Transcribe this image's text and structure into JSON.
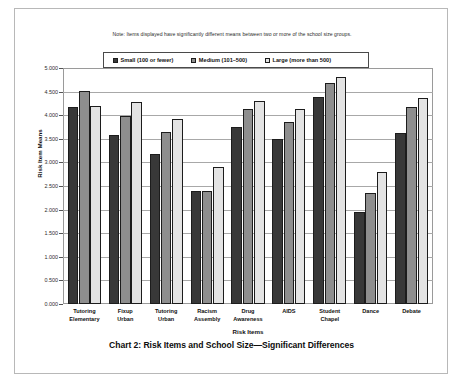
{
  "caption": "Chart 2: Risk Items and School Size—Significant Differences",
  "note": "Note: Items displayed have significantly different means between two or more of the school size groups.",
  "legend": {
    "items": [
      {
        "label": "Small (100 or fewer)",
        "color": "#383838"
      },
      {
        "label": "Medium (101–500)",
        "color": "#8e8e8e"
      },
      {
        "label": "Large (more than 500)",
        "color": "#e3e3e3"
      }
    ]
  },
  "chart_data": {
    "type": "bar",
    "title": "Chart 2: Risk Items and School Size—Significant Differences",
    "subtitle": "Note: Items displayed have significantly different means between two or more of the school size groups.",
    "xlabel": "Risk Items",
    "ylabel": "Risk Item Means",
    "ylim": [
      0.0,
      5.0
    ],
    "yticks": [
      "0.000",
      "0.500",
      "1.000",
      "1.500",
      "2.000",
      "2.500",
      "3.000",
      "3.500",
      "4.000",
      "4.500",
      "5.000"
    ],
    "ytick_values": [
      0.0,
      0.5,
      1.0,
      1.5,
      2.0,
      2.5,
      3.0,
      3.5,
      4.0,
      4.5,
      5.0
    ],
    "grid": true,
    "legend_position": "top-center",
    "categories": [
      "Tutoring Elementary",
      "Fixup Urban",
      "Tutoring Urban",
      "Racism Assembly",
      "Drug Awareness",
      "AIDS",
      "Student Chapel",
      "Dance",
      "Debate"
    ],
    "category_lines": [
      [
        "Tutoring",
        "Elementary"
      ],
      [
        "Fixup",
        "Urban"
      ],
      [
        "Tutoring",
        "Urban"
      ],
      [
        "Racism",
        "Assembly"
      ],
      [
        "Drug",
        "Awareness"
      ],
      [
        "AIDS",
        ""
      ],
      [
        "Student",
        "Chapel"
      ],
      [
        "Dance",
        ""
      ],
      [
        "Debate",
        ""
      ]
    ],
    "series": [
      {
        "name": "Small (100 or fewer)",
        "color": "#383838",
        "values": [
          4.17,
          3.58,
          3.18,
          2.39,
          3.75,
          3.5,
          4.39,
          1.95,
          3.63
        ]
      },
      {
        "name": "Medium (101–500)",
        "color": "#8e8e8e",
        "values": [
          4.51,
          3.98,
          3.64,
          2.4,
          4.13,
          3.86,
          4.68,
          2.35,
          4.18
        ]
      },
      {
        "name": "Large (more than 500)",
        "color": "#e3e3e3",
        "values": [
          4.19,
          4.28,
          3.92,
          2.9,
          4.3,
          4.13,
          4.81,
          2.8,
          4.37
        ]
      }
    ]
  }
}
